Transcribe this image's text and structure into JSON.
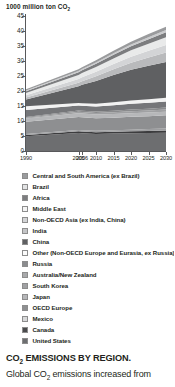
{
  "chart_data": {
    "type": "area",
    "title": "1000 million ton CO2",
    "title_prefix": "1000 million ton CO",
    "title_sub": "2",
    "xlabel": "",
    "ylabel": "",
    "ylim": [
      0,
      45
    ],
    "yticks": [
      0,
      5,
      10,
      15,
      20,
      25,
      30,
      35,
      40,
      45
    ],
    "grid": false,
    "legend_position": "below",
    "x": [
      1990,
      2005,
      2006,
      2010,
      2015,
      2020,
      2025,
      2030
    ],
    "xtick_labels": [
      "1990",
      "2005",
      "2006",
      "2010",
      "2015",
      "2020",
      "2025",
      "2030"
    ],
    "stack_order_bottom_to_top": [
      "United States",
      "Canada",
      "Mexico",
      "OECD Europe",
      "Japan",
      "South Korea",
      "Australia/New Zealand",
      "Russia",
      "Other (Non-OECD Europe and Eurasia, ex Russia)",
      "China",
      "India",
      "Non-OECD Asia (ex India, China)",
      "Middle East",
      "Africa",
      "Brazil",
      "Central and South America (ex Brazil)"
    ],
    "series": [
      {
        "name": "United States",
        "color": "#6d6e70",
        "values": [
          4.9,
          6.0,
          5.9,
          5.7,
          5.8,
          5.9,
          6.0,
          6.1
        ]
      },
      {
        "name": "Canada",
        "color": "#3c3c3e",
        "values": [
          0.45,
          0.58,
          0.58,
          0.58,
          0.62,
          0.66,
          0.7,
          0.74
        ]
      },
      {
        "name": "Mexico",
        "color": "#9d9e a0",
        "values": [
          0.3,
          0.42,
          0.43,
          0.45,
          0.5,
          0.56,
          0.62,
          0.68
        ]
      },
      {
        "name": "OECD Europe",
        "color": "#8e8f91",
        "values": [
          4.1,
          4.3,
          4.3,
          4.2,
          4.2,
          4.3,
          4.3,
          4.4
        ]
      },
      {
        "name": "Japan",
        "color": "#b6b7b9",
        "values": [
          1.05,
          1.25,
          1.25,
          1.22,
          1.2,
          1.2,
          1.18,
          1.16
        ]
      },
      {
        "name": "South Korea",
        "color": "#a0a1a3",
        "values": [
          0.25,
          0.5,
          0.51,
          0.54,
          0.6,
          0.66,
          0.71,
          0.76
        ]
      },
      {
        "name": "Australia/New Zealand",
        "color": "#8a8b8d",
        "values": [
          0.3,
          0.43,
          0.44,
          0.46,
          0.5,
          0.54,
          0.58,
          0.62
        ]
      },
      {
        "name": "Russia",
        "color": "#757679",
        "values": [
          2.3,
          1.65,
          1.68,
          1.72,
          1.82,
          1.92,
          2.0,
          2.08
        ]
      },
      {
        "name": "Other (Non-OECD Europe and Eurasia, ex Russia)",
        "color": "#f2f2f2",
        "values": [
          1.25,
          0.85,
          0.86,
          0.9,
          0.98,
          1.06,
          1.14,
          1.22
        ]
      },
      {
        "name": "China",
        "color": "#5f6062",
        "values": [
          2.3,
          5.6,
          6.1,
          7.6,
          9.1,
          10.3,
          11.2,
          11.9
        ]
      },
      {
        "name": "India",
        "color": "#b9babc",
        "values": [
          0.6,
          1.15,
          1.22,
          1.55,
          1.95,
          2.35,
          2.75,
          3.15
        ]
      },
      {
        "name": "Non-OECD Asia (ex India, China)",
        "color": "#d3d4d6",
        "values": [
          0.75,
          1.25,
          1.3,
          1.5,
          1.75,
          2.0,
          2.25,
          2.5
        ]
      },
      {
        "name": "Middle East",
        "color": "#e9eaea",
        "values": [
          0.75,
          1.35,
          1.4,
          1.6,
          1.85,
          2.1,
          2.35,
          2.6
        ]
      },
      {
        "name": "Africa",
        "color": "#7c7d7f",
        "values": [
          0.65,
          0.95,
          0.97,
          1.05,
          1.2,
          1.35,
          1.5,
          1.65
        ]
      },
      {
        "name": "Brazil",
        "color": "#cacbcd",
        "values": [
          0.22,
          0.35,
          0.36,
          0.42,
          0.5,
          0.58,
          0.66,
          0.74
        ]
      },
      {
        "name": "Central and South America (ex Brazil)",
        "color": "#9a9b9d",
        "values": [
          0.45,
          0.63,
          0.65,
          0.72,
          0.82,
          0.92,
          1.02,
          1.12
        ]
      }
    ],
    "totals": [
      21.6,
      28.3,
      29.2,
      32.2,
      35.4,
      38.4,
      40.9,
      43.2
    ]
  },
  "legend": {
    "items": [
      {
        "label": "Central and South America (ex Brazil)",
        "color": "#9a9b9d"
      },
      {
        "label": "Brazil",
        "color": "#e2e3e4"
      },
      {
        "label": "Africa",
        "color": "#7c7d7f"
      },
      {
        "label": "Middle East",
        "color": "#f4f4f4"
      },
      {
        "label": "Non-OECD Asia (ex India, China)",
        "color": "#d3d4d6"
      },
      {
        "label": "India",
        "color": "#c4c5c7"
      },
      {
        "label": "China",
        "color": "#5f6062"
      },
      {
        "label": "Other (Non-OECD Europe and Eurasia, ex Russia)",
        "color": "#fbfbfb"
      },
      {
        "label": "Russia",
        "color": "#8b8c8e"
      },
      {
        "label": "Australia/New Zealand",
        "color": "#a8a9ab"
      },
      {
        "label": "South Korea",
        "color": "#a0a1a3"
      },
      {
        "label": "Japan",
        "color": "#b6b7b9"
      },
      {
        "label": "OECD Europe",
        "color": "#8e8f91"
      },
      {
        "label": "Mexico",
        "color": "#d8d9da"
      },
      {
        "label": "Canada",
        "color": "#4a4b4d"
      },
      {
        "label": "United States",
        "color": "#6d6e70"
      }
    ]
  },
  "caption": {
    "heading_prefix": "CO",
    "heading_sub": "2",
    "heading_rest": " EMISSIONS BY REGION.",
    "body_part1": "Global CO",
    "body_sub": "2",
    "body_part2": " emissions increased from"
  }
}
